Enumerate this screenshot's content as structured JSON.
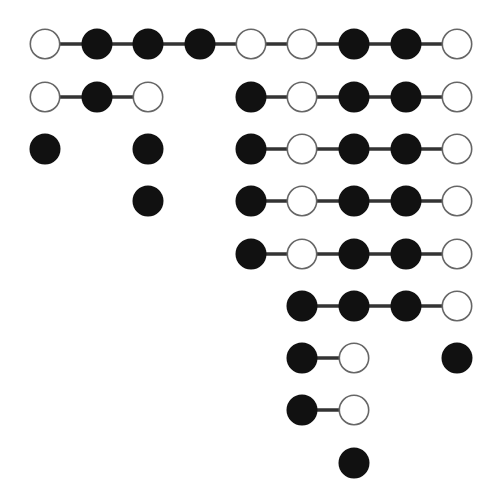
{
  "diagram": {
    "title": "",
    "grid": {
      "col_x": [
        45,
        97,
        148,
        200,
        251,
        302,
        354,
        406,
        457
      ],
      "row_y": [
        44,
        97,
        149,
        201,
        254,
        306,
        358,
        410,
        463
      ],
      "radius": 15.5
    },
    "colors": {
      "filled": "#111111",
      "hollow_fill": "#ffffff",
      "hollow_stroke": "#666666",
      "edge": "#333333"
    },
    "chains": [
      {
        "row": 0,
        "start_col": 0,
        "states": [
          "O",
          "F",
          "F",
          "F",
          "O",
          "O",
          "F",
          "F",
          "O"
        ]
      },
      {
        "row": 1,
        "start_col": 0,
        "states": [
          "O",
          "F",
          "O"
        ]
      },
      {
        "row": 1,
        "start_col": 4,
        "states": [
          "F",
          "O",
          "F",
          "F",
          "O"
        ]
      },
      {
        "row": 2,
        "start_col": 0,
        "states": [
          "F"
        ]
      },
      {
        "row": 2,
        "start_col": 2,
        "states": [
          "F"
        ]
      },
      {
        "row": 2,
        "start_col": 4,
        "states": [
          "F",
          "O",
          "F",
          "F",
          "O"
        ]
      },
      {
        "row": 3,
        "start_col": 2,
        "states": [
          "F"
        ]
      },
      {
        "row": 3,
        "start_col": 4,
        "states": [
          "F",
          "O",
          "F",
          "F",
          "O"
        ]
      },
      {
        "row": 4,
        "start_col": 4,
        "states": [
          "F",
          "O",
          "F",
          "F",
          "O"
        ]
      },
      {
        "row": 5,
        "start_col": 5,
        "states": [
          "F",
          "F",
          "F",
          "O"
        ]
      },
      {
        "row": 6,
        "start_col": 5,
        "states": [
          "F",
          "O"
        ]
      },
      {
        "row": 6,
        "start_col": 8,
        "states": [
          "F"
        ]
      },
      {
        "row": 7,
        "start_col": 5,
        "states": [
          "F",
          "O"
        ]
      },
      {
        "row": 8,
        "start_col": 6,
        "states": [
          "F"
        ]
      }
    ],
    "legend": {
      "F": "filled-node",
      "O": "hollow-node"
    }
  }
}
